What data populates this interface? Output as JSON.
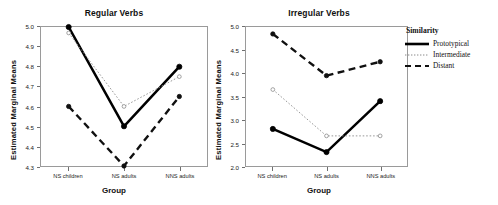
{
  "legend": {
    "title": "Similarity",
    "entries": [
      {
        "label": "Prototypical",
        "style": "solid"
      },
      {
        "label": "Intermediate",
        "style": "dotted"
      },
      {
        "label": "Distant",
        "style": "dashed"
      }
    ]
  },
  "chart_data": [
    {
      "type": "line",
      "title": "Regular Verbs",
      "xlabel": "Group",
      "ylabel": "Estimated Marginal Means",
      "categories": [
        "NS children",
        "NS adults",
        "NNS adults"
      ],
      "yticks": [
        "4.3",
        "4.4",
        "4.5",
        "4.6",
        "4.7",
        "4.8",
        "4.9",
        "5.0"
      ],
      "ylim": [
        4.3,
        5.0
      ],
      "grid": false,
      "legend_position": "right",
      "series": [
        {
          "name": "Prototypical",
          "style": "solid",
          "values": [
            5.0,
            4.5,
            4.8
          ]
        },
        {
          "name": "Intermediate",
          "style": "dotted",
          "values": [
            4.97,
            4.6,
            4.75
          ]
        },
        {
          "name": "Distant",
          "style": "dashed",
          "values": [
            4.6,
            4.3,
            4.65
          ]
        }
      ]
    },
    {
      "type": "line",
      "title": "Irregular Verbs",
      "xlabel": "Group",
      "ylabel": "Estimated Marginal Means",
      "categories": [
        "NS children",
        "NS adults",
        "NNS adults"
      ],
      "yticks": [
        "2.0",
        "2.5",
        "3.0",
        "3.5",
        "4.0",
        "4.5",
        "5.0"
      ],
      "ylim": [
        2.0,
        5.0
      ],
      "grid": false,
      "legend_position": "right",
      "series": [
        {
          "name": "Prototypical",
          "style": "solid",
          "values": [
            2.8,
            2.3,
            3.4
          ]
        },
        {
          "name": "Intermediate",
          "style": "dotted",
          "values": [
            3.65,
            2.65,
            2.65
          ]
        },
        {
          "name": "Distant",
          "style": "dashed",
          "values": [
            4.85,
            3.95,
            4.25
          ]
        }
      ]
    }
  ]
}
